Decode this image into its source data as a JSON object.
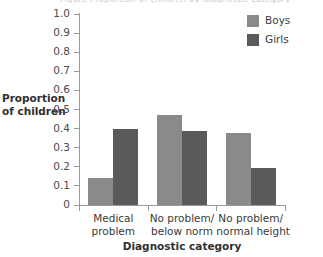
{
  "figure": {
    "clipped_caption": "Figure   Proportion of children by diagnostic category"
  },
  "legend": {
    "position": "top-right",
    "entries": [
      {
        "label": "Boys",
        "color": "#8a8a8a",
        "swatch_name": "legend-swatch-boys"
      },
      {
        "label": "Girls",
        "color": "#5a5a5a",
        "swatch_name": "legend-swatch-girls"
      }
    ]
  },
  "axes": {
    "y_title_line1": "Proportion",
    "y_title_line2": "of children",
    "x_title": "Diagnostic category",
    "y_ticks": [
      "1.0",
      "0.9",
      "0.8",
      "0.7",
      "0.6",
      "0.5",
      "0.4",
      "0.3",
      "0.2",
      "0.1",
      "0"
    ]
  },
  "chart_data": {
    "type": "bar",
    "title": "",
    "subtitle": "",
    "xlabel": "Diagnostic category",
    "ylabel": "Proportion of children",
    "ylim": [
      0,
      1.0
    ],
    "ytick_values": [
      1.0,
      0.9,
      0.8,
      0.7,
      0.6,
      0.5,
      0.4,
      0.3,
      0.2,
      0.1,
      0
    ],
    "grid": false,
    "legend_position": "top-right",
    "categories": [
      "Medical problem",
      "No problem/below norm",
      "No problem/normal height"
    ],
    "category_lines": [
      [
        "Medical",
        "problem"
      ],
      [
        "No problem/",
        "below norm"
      ],
      [
        "No problem/",
        "normal height"
      ]
    ],
    "series": [
      {
        "name": "Boys",
        "color": "#8a8a8a",
        "values": [
          0.14,
          0.47,
          0.375
        ]
      },
      {
        "name": "Girls",
        "color": "#5a5a5a",
        "values": [
          0.4,
          0.39,
          0.195
        ]
      }
    ]
  }
}
